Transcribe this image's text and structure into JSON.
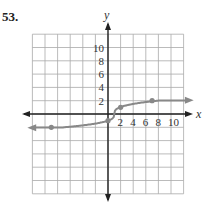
{
  "problem_number": "53.",
  "chart_data": {
    "type": "line",
    "title": "",
    "xlabel": "x",
    "ylabel": "y",
    "xlim": [
      -12,
      12
    ],
    "ylim": [
      -12,
      12
    ],
    "grid": true,
    "grid_step": 2,
    "x_tick_labels": [
      "2",
      "4",
      "6",
      "8",
      "10"
    ],
    "y_tick_labels": [
      "2",
      "4",
      "6",
      "8",
      "10"
    ],
    "series": [
      {
        "name": "f(x)",
        "description": "cube-root shaped curve, approaching y=-2 on left and y=2 on right",
        "points": [
          [
            -9,
            -2
          ],
          [
            0,
            -1
          ],
          [
            1,
            0
          ],
          [
            2,
            1
          ],
          [
            7,
            2
          ]
        ],
        "curve_color": "#888888"
      }
    ],
    "labeled_points": [
      [
        -9,
        -2
      ],
      [
        0,
        -1
      ],
      [
        2,
        1
      ],
      [
        7,
        2
      ]
    ]
  }
}
